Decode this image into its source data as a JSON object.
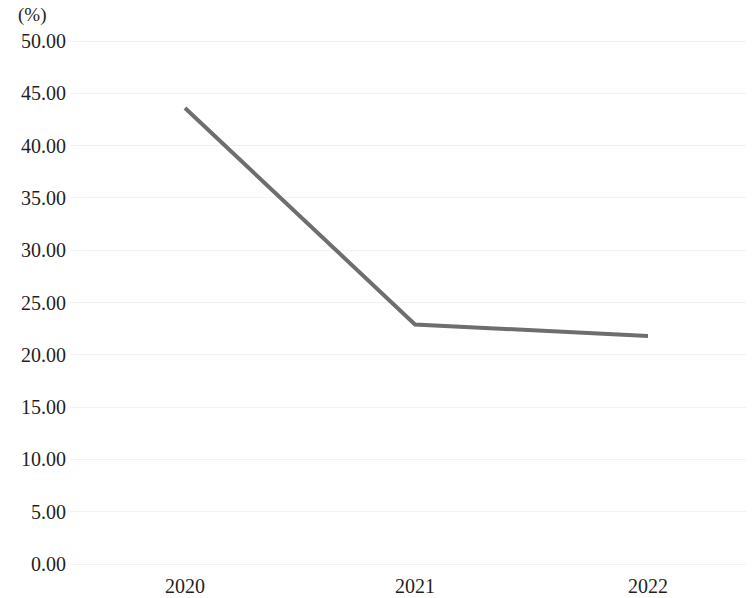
{
  "chart_data": {
    "type": "line",
    "title": "",
    "subtitle": "",
    "xlabel": "",
    "ylabel": "(%)",
    "categories": [
      "2020",
      "2021",
      "2022"
    ],
    "series": [
      {
        "name": "",
        "values": [
          43.6,
          22.9,
          21.8
        ],
        "color": "#6e6e6e"
      }
    ],
    "ylim": [
      0,
      50
    ],
    "y_ticks": [
      "0.00",
      "5.00",
      "10.00",
      "15.00",
      "20.00",
      "25.00",
      "30.00",
      "35.00",
      "40.00",
      "45.00",
      "50.00"
    ],
    "y_tick_values": [
      0,
      5,
      10,
      15,
      20,
      25,
      30,
      35,
      40,
      45,
      50
    ],
    "x_ticks": [
      "2020",
      "2021",
      "2022"
    ],
    "grid": "horizontal",
    "grid_color": "#f2f2f2",
    "legend": "none",
    "markers": "none",
    "line_width": 4,
    "annotations": []
  },
  "axes": {
    "y_unit_label": "(%)"
  }
}
